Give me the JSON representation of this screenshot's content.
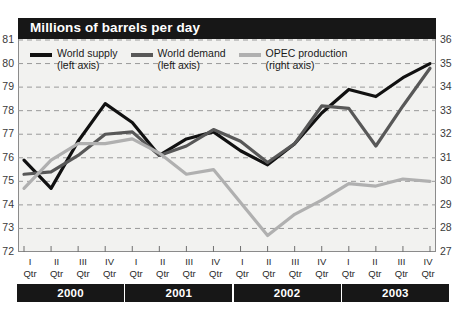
{
  "title": "Millions of barrels per day",
  "legend": [
    {
      "name": "World supply",
      "axis": "(left axis)",
      "color": "#111111"
    },
    {
      "name": "World demand",
      "axis": "(left axis)",
      "color": "#585858"
    },
    {
      "name": "OPEC production",
      "axis": "(right axis)",
      "color": "#b0b0b0"
    }
  ],
  "axes": {
    "left_ticks": [
      "81",
      "80",
      "79",
      "78",
      "77",
      "76",
      "75",
      "74",
      "73",
      "72"
    ],
    "right_ticks": [
      "36",
      "35",
      "34",
      "33",
      "32",
      "31",
      "30",
      "29",
      "28",
      "27"
    ]
  },
  "quarters": [
    {
      "roman": "I",
      "qtr": "Qtr"
    },
    {
      "roman": "II",
      "qtr": "Qtr"
    },
    {
      "roman": "III",
      "qtr": "Qtr"
    },
    {
      "roman": "IV",
      "qtr": "Qtr"
    },
    {
      "roman": "I",
      "qtr": "Qtr"
    },
    {
      "roman": "II",
      "qtr": "Qtr"
    },
    {
      "roman": "III",
      "qtr": "Qtr"
    },
    {
      "roman": "IV",
      "qtr": "Qtr"
    },
    {
      "roman": "I",
      "qtr": "Qtr"
    },
    {
      "roman": "II",
      "qtr": "Qtr"
    },
    {
      "roman": "III",
      "qtr": "Qtr"
    },
    {
      "roman": "IV",
      "qtr": "Qtr"
    },
    {
      "roman": "I",
      "qtr": "Qtr"
    },
    {
      "roman": "II",
      "qtr": "Qtr"
    },
    {
      "roman": "III",
      "qtr": "Qtr"
    },
    {
      "roman": "IV",
      "qtr": "Qtr"
    }
  ],
  "years": [
    "2000",
    "2001",
    "2002",
    "2003"
  ],
  "chart_data": {
    "type": "line",
    "title": "Millions of barrels per day",
    "xlabel": "",
    "ylabel": "Millions of barrels per day",
    "ylim": [
      72,
      81
    ],
    "y2lim": [
      27,
      36
    ],
    "grid": true,
    "legend_position": "top-left",
    "x": [
      "2000 I Qtr",
      "2000 II Qtr",
      "2000 III Qtr",
      "2000 IV Qtr",
      "2001 I Qtr",
      "2001 II Qtr",
      "2001 III Qtr",
      "2001 IV Qtr",
      "2002 I Qtr",
      "2002 II Qtr",
      "2002 III Qtr",
      "2002 IV Qtr",
      "2003 I Qtr",
      "2003 II Qtr",
      "2003 III Qtr",
      "2003 IV Qtr"
    ],
    "series": [
      {
        "name": "World supply",
        "axis": "left",
        "color": "#111111",
        "values": [
          75.9,
          74.7,
          76.7,
          78.3,
          77.5,
          76.1,
          76.8,
          77.1,
          76.3,
          75.7,
          76.6,
          77.9,
          78.9,
          78.6,
          79.4,
          80.0
        ]
      },
      {
        "name": "World demand",
        "axis": "left",
        "color": "#585858",
        "values": [
          75.3,
          75.4,
          76.1,
          77.0,
          77.1,
          76.1,
          76.5,
          77.2,
          76.7,
          75.8,
          76.6,
          78.2,
          78.1,
          76.5,
          78.2,
          79.8
        ]
      },
      {
        "name": "OPEC production",
        "axis": "right",
        "color": "#b0b0b0",
        "values": [
          29.7,
          30.9,
          31.6,
          31.6,
          31.8,
          31.2,
          30.3,
          30.5,
          29.1,
          27.7,
          28.6,
          29.2,
          29.9,
          29.8,
          30.1,
          30.0
        ]
      }
    ]
  }
}
